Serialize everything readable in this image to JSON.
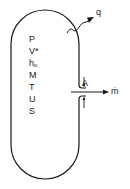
{
  "diagram": {
    "type": "control-volume",
    "vessel": {
      "shape": "stadium",
      "stroke": "#1a1a1a"
    },
    "state_variables": [
      {
        "symbol": "P"
      },
      {
        "symbol": "V*"
      },
      {
        "symbol": "h",
        "subscript": "o"
      },
      {
        "symbol": "M"
      },
      {
        "symbol": "T"
      },
      {
        "symbol": "U"
      },
      {
        "symbol": "S"
      }
    ],
    "heat_transfer": {
      "label": "q",
      "arrow": "wavy-arrow-outward"
    },
    "outlet": {
      "area_label": "A",
      "flow_label": "ṁ",
      "arrow": "arrow-right"
    }
  }
}
